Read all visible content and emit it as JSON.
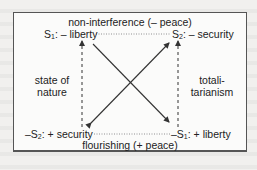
{
  "diagram": {
    "top_label": "non-interference (– peace)",
    "bottom_label": "flourishing (+ peace)",
    "nodes": {
      "top_left": {
        "prefix": "S",
        "sub": "1",
        "text": ": – liberty"
      },
      "top_right": {
        "prefix": "S",
        "sub": "2",
        "text": ": – security"
      },
      "bottom_left": {
        "prefix": "–S",
        "sub": "2",
        "text": ": + security"
      },
      "bottom_right": {
        "prefix": "–S",
        "sub": "1",
        "text": ": + liberty"
      }
    },
    "left_side": {
      "line1": "state of",
      "line2": "nature"
    },
    "right_side": {
      "line1": "totali-",
      "line2": "tarianism"
    },
    "edges": [
      {
        "from": "top_left",
        "to": "top_right",
        "style": "dotted",
        "relation": "contrariety"
      },
      {
        "from": "bottom_left",
        "to": "bottom_right",
        "style": "dotted",
        "relation": "subcontrariety"
      },
      {
        "from": "bottom_left",
        "to": "top_left",
        "style": "dashed",
        "arrow": "up"
      },
      {
        "from": "bottom_right",
        "to": "top_right",
        "style": "dashed",
        "arrow": "up"
      },
      {
        "from": "top_left",
        "to": "bottom_right",
        "style": "solid",
        "arrow": "end"
      },
      {
        "from": "bottom_left",
        "to": "top_right",
        "style": "solid",
        "arrow": "both"
      }
    ],
    "colors": {
      "line": "#333333",
      "border": "#555555",
      "background": "#f1f0ee"
    }
  }
}
